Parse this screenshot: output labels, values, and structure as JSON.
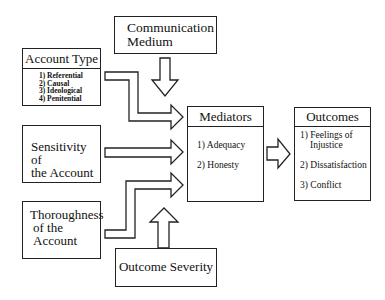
{
  "diagram": {
    "communication_medium": {
      "line1": "Communication",
      "line2": "Medium"
    },
    "account_type": {
      "title": "Account Type",
      "items": [
        "1) Referential",
        "2) Causal",
        "3) Ideological",
        "4) Penitential"
      ]
    },
    "sensitivity": {
      "line1": "Sensitivity of",
      "line2": "the Account"
    },
    "thoroughness": {
      "line1": "Thoroughness",
      "line2": "of the",
      "line3": "Account"
    },
    "outcome_severity": {
      "label": "Outcome Severity"
    },
    "mediators": {
      "title": "Mediators",
      "items": [
        "1) Adequacy",
        "2) Honesty"
      ]
    },
    "outcomes": {
      "title": "Outcomes",
      "items": [
        "1) Feelings of",
        "Injustice",
        "2) Dissatisfaction",
        "3)  Conflict"
      ]
    }
  }
}
